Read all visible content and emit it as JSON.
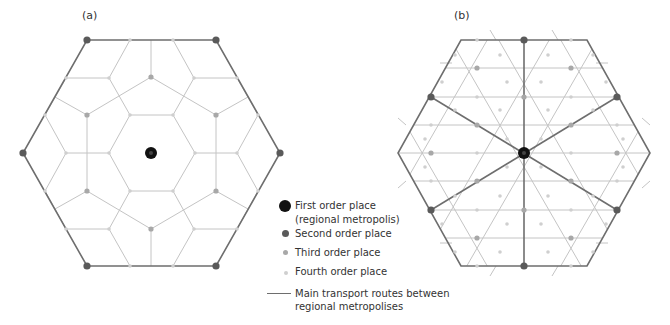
{
  "colors": {
    "first": "#111111",
    "second": "#5a5a5a",
    "third": "#a8a8a8",
    "fourth": "#cfcfcf",
    "route": "#6e6e6e",
    "grid": "#c4c4c4"
  },
  "panels": [
    {
      "label": "(a)",
      "x": 82,
      "y": 10
    },
    {
      "label": "(b)",
      "x": 454,
      "y": 10
    }
  ],
  "legend": {
    "items": [
      {
        "label1": "First order place",
        "label2": "(regional metropolis)",
        "symbol": "first-order"
      },
      {
        "label1": "Second order place",
        "symbol": "second-order"
      },
      {
        "label1": "Third order place",
        "symbol": "third-order"
      },
      {
        "label1": "Fourth order place",
        "symbol": "fourth-order"
      },
      {
        "label1": "Main transport routes between",
        "label2": "regional metropolises",
        "symbol": "route-line"
      }
    ]
  },
  "diagram_a": {
    "outer": [
      [
        87,
        40
      ],
      [
        216,
        40
      ],
      [
        280,
        153
      ],
      [
        216,
        266
      ],
      [
        87,
        266
      ],
      [
        23,
        153
      ]
    ],
    "first": [
      [
        151,
        153
      ]
    ],
    "second": [
      [
        87,
        40
      ],
      [
        216,
        40
      ],
      [
        280,
        153
      ],
      [
        216,
        266
      ],
      [
        87,
        266
      ],
      [
        23,
        153
      ]
    ],
    "third": [
      [
        151,
        77
      ],
      [
        87,
        115
      ],
      [
        216,
        115
      ],
      [
        87,
        191
      ],
      [
        216,
        191
      ],
      [
        151,
        229
      ]
    ],
    "fourth": [
      [
        130,
        40
      ],
      [
        173,
        40
      ],
      [
        66,
        78
      ],
      [
        109,
        78
      ],
      [
        194,
        78
      ],
      [
        237,
        78
      ],
      [
        45,
        115
      ],
      [
        130,
        115
      ],
      [
        173,
        115
      ],
      [
        258,
        115
      ],
      [
        66,
        153
      ],
      [
        109,
        153
      ],
      [
        195,
        153
      ],
      [
        237,
        153
      ],
      [
        45,
        191
      ],
      [
        130,
        191
      ],
      [
        173,
        191
      ],
      [
        258,
        191
      ],
      [
        66,
        229
      ],
      [
        109,
        229
      ],
      [
        194,
        229
      ],
      [
        237,
        229
      ],
      [
        130,
        266
      ],
      [
        173,
        266
      ]
    ],
    "lines": [
      [
        [
          130,
          40
        ],
        [
          109,
          78
        ]
      ],
      [
        [
          173,
          40
        ],
        [
          194,
          78
        ]
      ],
      [
        [
          151,
          40
        ],
        [
          151,
          77
        ]
      ],
      [
        [
          66,
          78
        ],
        [
          109,
          78
        ]
      ],
      [
        [
          194,
          78
        ],
        [
          237,
          78
        ]
      ],
      [
        [
          109,
          78
        ],
        [
          130,
          115
        ]
      ],
      [
        [
          194,
          78
        ],
        [
          173,
          115
        ]
      ],
      [
        [
          55,
          97
        ],
        [
          87,
          115
        ]
      ],
      [
        [
          87,
          115
        ],
        [
          151,
          77
        ]
      ],
      [
        [
          151,
          77
        ],
        [
          216,
          115
        ]
      ],
      [
        [
          216,
          115
        ],
        [
          248,
          97
        ]
      ],
      [
        [
          66,
          78
        ],
        [
          45,
          115
        ]
      ],
      [
        [
          237,
          78
        ],
        [
          258,
          115
        ]
      ],
      [
        [
          130,
          115
        ],
        [
          173,
          115
        ]
      ],
      [
        [
          173,
          115
        ],
        [
          195,
          153
        ]
      ],
      [
        [
          195,
          153
        ],
        [
          173,
          191
        ]
      ],
      [
        [
          173,
          191
        ],
        [
          130,
          191
        ]
      ],
      [
        [
          130,
          191
        ],
        [
          109,
          153
        ]
      ],
      [
        [
          109,
          153
        ],
        [
          130,
          115
        ]
      ],
      [
        [
          87,
          115
        ],
        [
          87,
          191
        ]
      ],
      [
        [
          216,
          115
        ],
        [
          216,
          191
        ]
      ],
      [
        [
          45,
          115
        ],
        [
          66,
          153
        ]
      ],
      [
        [
          66,
          153
        ],
        [
          109,
          153
        ]
      ],
      [
        [
          66,
          153
        ],
        [
          45,
          191
        ]
      ],
      [
        [
          258,
          115
        ],
        [
          237,
          153
        ]
      ],
      [
        [
          237,
          153
        ],
        [
          195,
          153
        ]
      ],
      [
        [
          237,
          153
        ],
        [
          258,
          191
        ]
      ],
      [
        [
          55,
          209
        ],
        [
          87,
          191
        ]
      ],
      [
        [
          87,
          191
        ],
        [
          151,
          229
        ]
      ],
      [
        [
          151,
          229
        ],
        [
          216,
          191
        ]
      ],
      [
        [
          216,
          191
        ],
        [
          248,
          209
        ]
      ],
      [
        [
          45,
          191
        ],
        [
          66,
          229
        ]
      ],
      [
        [
          258,
          191
        ],
        [
          237,
          229
        ]
      ],
      [
        [
          130,
          191
        ],
        [
          109,
          229
        ]
      ],
      [
        [
          173,
          191
        ],
        [
          194,
          229
        ]
      ],
      [
        [
          66,
          229
        ],
        [
          109,
          229
        ]
      ],
      [
        [
          194,
          229
        ],
        [
          237,
          229
        ]
      ],
      [
        [
          109,
          229
        ],
        [
          130,
          266
        ]
      ],
      [
        [
          194,
          229
        ],
        [
          173,
          266
        ]
      ],
      [
        [
          151,
          229
        ],
        [
          151,
          266
        ]
      ]
    ]
  },
  "diagram_b": {
    "outer": [
      [
        461,
        40
      ],
      [
        587,
        40
      ],
      [
        650,
        153
      ],
      [
        587,
        266
      ],
      [
        461,
        266
      ],
      [
        398,
        153
      ]
    ],
    "first": [
      [
        524,
        153
      ]
    ],
    "second": [
      [
        524,
        40
      ],
      [
        431,
        97
      ],
      [
        617,
        97
      ],
      [
        431,
        210
      ],
      [
        617,
        210
      ],
      [
        524,
        266
      ]
    ],
    "third": [
      [
        477,
        68
      ],
      [
        571,
        68
      ],
      [
        524,
        97
      ],
      [
        477,
        125
      ],
      [
        571,
        125
      ],
      [
        431,
        153
      ],
      [
        617,
        153
      ],
      [
        477,
        181
      ],
      [
        571,
        181
      ],
      [
        524,
        210
      ],
      [
        477,
        238
      ],
      [
        571,
        238
      ]
    ],
    "fourth": [
      [
        477,
        40
      ],
      [
        571,
        40
      ],
      [
        455,
        55
      ],
      [
        500,
        55
      ],
      [
        548,
        55
      ],
      [
        593,
        55
      ],
      [
        442,
        82
      ],
      [
        507,
        82
      ],
      [
        541,
        82
      ],
      [
        606,
        82
      ],
      [
        477,
        97
      ],
      [
        571,
        97
      ],
      [
        455,
        110
      ],
      [
        500,
        110
      ],
      [
        548,
        110
      ],
      [
        593,
        110
      ],
      [
        431,
        125
      ],
      [
        617,
        125
      ],
      [
        425,
        139
      ],
      [
        507,
        139
      ],
      [
        541,
        139
      ],
      [
        623,
        139
      ],
      [
        477,
        153
      ],
      [
        571,
        153
      ],
      [
        425,
        167
      ],
      [
        507,
        167
      ],
      [
        541,
        167
      ],
      [
        623,
        167
      ],
      [
        431,
        181
      ],
      [
        617,
        181
      ],
      [
        455,
        196
      ],
      [
        500,
        196
      ],
      [
        548,
        196
      ],
      [
        593,
        196
      ],
      [
        477,
        210
      ],
      [
        571,
        210
      ],
      [
        442,
        224
      ],
      [
        507,
        224
      ],
      [
        541,
        224
      ],
      [
        606,
        224
      ],
      [
        455,
        252
      ],
      [
        500,
        252
      ],
      [
        548,
        252
      ],
      [
        593,
        252
      ],
      [
        477,
        266
      ],
      [
        571,
        266
      ]
    ],
    "routes": [
      [
        [
          524,
          40
        ],
        [
          524,
          266
        ]
      ],
      [
        [
          431,
          97
        ],
        [
          617,
          210
        ]
      ],
      [
        [
          617,
          97
        ],
        [
          431,
          210
        ]
      ]
    ],
    "lines": [
      [
        [
          398,
          153
        ],
        [
          650,
          153
        ]
      ],
      [
        [
          414,
          125
        ],
        [
          634,
          125
        ]
      ],
      [
        [
          414,
          181
        ],
        [
          634,
          181
        ]
      ],
      [
        [
          430,
          97
        ],
        [
          618,
          97
        ]
      ],
      [
        [
          430,
          210
        ],
        [
          618,
          210
        ]
      ],
      [
        [
          446,
          68
        ],
        [
          602,
          68
        ]
      ],
      [
        [
          446,
          238
        ],
        [
          602,
          238
        ]
      ],
      [
        [
          493,
          30
        ],
        [
          398,
          195
        ]
      ],
      [
        [
          555,
          30
        ],
        [
          414,
          275
        ]
      ],
      [
        [
          650,
          111
        ],
        [
          555,
          276
        ]
      ],
      [
        [
          603,
          30
        ],
        [
          461,
          276
        ]
      ],
      [
        [
          445,
          30
        ],
        [
          587,
          276
        ]
      ],
      [
        [
          493,
          30
        ],
        [
          634,
          276
        ]
      ],
      [
        [
          555,
          30
        ],
        [
          650,
          195
        ]
      ],
      [
        [
          398,
          111
        ],
        [
          493,
          276
        ]
      ],
      [
        [
          603,
          30
        ],
        [
          650,
          111
        ]
      ],
      [
        [
          445,
          30
        ],
        [
          398,
          111
        ]
      ]
    ],
    "ticks": [
      [
        [
          490,
          30
        ],
        [
          496,
          40
        ]
      ],
      [
        [
          552,
          30
        ],
        [
          558,
          40
        ]
      ],
      [
        [
          440,
          63
        ],
        [
          452,
          63
        ]
      ],
      [
        [
          596,
          63
        ],
        [
          608,
          63
        ]
      ],
      [
        [
          398,
          118
        ],
        [
          406,
          125
        ]
      ],
      [
        [
          642,
          118
        ],
        [
          650,
          125
        ]
      ],
      [
        [
          398,
          188
        ],
        [
          406,
          181
        ]
      ],
      [
        [
          642,
          188
        ],
        [
          650,
          181
        ]
      ],
      [
        [
          440,
          243
        ],
        [
          452,
          243
        ]
      ],
      [
        [
          596,
          243
        ],
        [
          608,
          243
        ]
      ],
      [
        [
          490,
          276
        ],
        [
          496,
          266
        ]
      ],
      [
        [
          552,
          276
        ],
        [
          558,
          266
        ]
      ]
    ]
  }
}
